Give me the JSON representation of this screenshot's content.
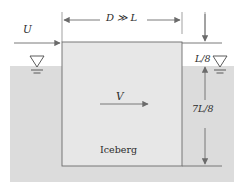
{
  "figure": {
    "labels": {
      "width_dimension": "D ≫ L",
      "free_stream_velocity": "U",
      "iceberg_velocity": "V",
      "freeboard": "L/8",
      "draft": "7L/8",
      "body_name": "Iceberg"
    },
    "icons": {
      "left_free_surface": "free-surface-triangle-icon",
      "right_free_surface": "free-surface-triangle-icon",
      "flow_arrow": "right-arrow-icon",
      "dimension_arrow_horizontal": "double-headed-arrow-icon",
      "dimension_arrow_vertical": "double-headed-arrow-icon"
    },
    "colors": {
      "water_fill": "#dcdcdc",
      "iceberg_fill": "#e7e7e7",
      "line": "#6b6b6b",
      "text": "#2b2b2b",
      "background": "#ffffff"
    },
    "geometry": {
      "iceberg_left_x": 62,
      "iceberg_right_x": 182,
      "iceberg_top_y": 42,
      "iceberg_bottom_y": 166,
      "water_surface_y": 66,
      "water_bottom_y": 182,
      "canvas_width": 245,
      "canvas_height": 193
    }
  }
}
